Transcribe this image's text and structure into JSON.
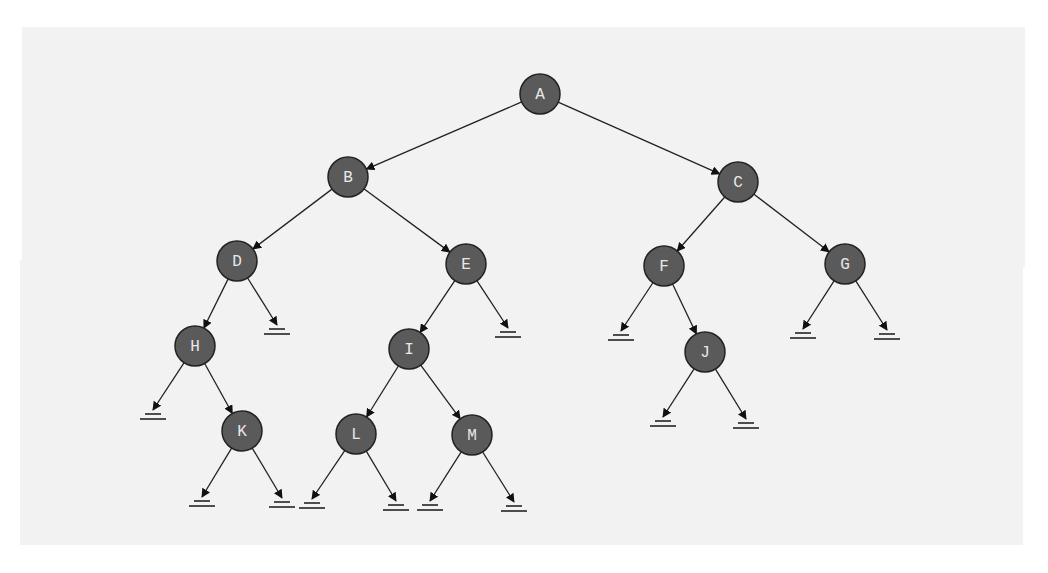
{
  "diagram": {
    "type": "binary-tree",
    "colors": {
      "node_fill": "#5a5a5a",
      "node_text": "#e8e8e8",
      "edge": "#222222",
      "background": "#f2f2f2"
    },
    "nodes": [
      {
        "id": "A",
        "label": "A",
        "x": 540,
        "y": 94
      },
      {
        "id": "B",
        "label": "B",
        "x": 348,
        "y": 177
      },
      {
        "id": "C",
        "label": "C",
        "x": 738,
        "y": 182
      },
      {
        "id": "D",
        "label": "D",
        "x": 237,
        "y": 261
      },
      {
        "id": "E",
        "label": "E",
        "x": 466,
        "y": 264
      },
      {
        "id": "F",
        "label": "F",
        "x": 664,
        "y": 266
      },
      {
        "id": "G",
        "label": "G",
        "x": 845,
        "y": 264
      },
      {
        "id": "H",
        "label": "H",
        "x": 195,
        "y": 346
      },
      {
        "id": "I",
        "label": "I",
        "x": 409,
        "y": 349
      },
      {
        "id": "J",
        "label": "J",
        "x": 705,
        "y": 352
      },
      {
        "id": "K",
        "label": "K",
        "x": 242,
        "y": 431
      },
      {
        "id": "L",
        "label": "L",
        "x": 356,
        "y": 434
      },
      {
        "id": "M",
        "label": "M",
        "x": 472,
        "y": 435
      }
    ],
    "edges": [
      [
        "A",
        "B"
      ],
      [
        "A",
        "C"
      ],
      [
        "B",
        "D"
      ],
      [
        "B",
        "E"
      ],
      [
        "C",
        "F"
      ],
      [
        "C",
        "G"
      ],
      [
        "D",
        "H"
      ],
      [
        "E",
        "I"
      ],
      [
        "F",
        "J"
      ],
      [
        "H",
        "K"
      ],
      [
        "I",
        "L"
      ],
      [
        "I",
        "M"
      ]
    ],
    "null_links": [
      {
        "from": "D",
        "x": 277,
        "y": 331
      },
      {
        "from": "E",
        "x": 508,
        "y": 334
      },
      {
        "from": "F",
        "x": 621,
        "y": 337
      },
      {
        "from": "G",
        "x": 803,
        "y": 335
      },
      {
        "from": "G",
        "x": 887,
        "y": 336
      },
      {
        "from": "H",
        "x": 153,
        "y": 416
      },
      {
        "from": "J",
        "x": 663,
        "y": 423
      },
      {
        "from": "J",
        "x": 746,
        "y": 425
      },
      {
        "from": "K",
        "x": 202,
        "y": 503
      },
      {
        "from": "K",
        "x": 282,
        "y": 504
      },
      {
        "from": "L",
        "x": 312,
        "y": 505
      },
      {
        "from": "L",
        "x": 396,
        "y": 507
      },
      {
        "from": "M",
        "x": 430,
        "y": 507
      },
      {
        "from": "M",
        "x": 514,
        "y": 508
      }
    ]
  }
}
